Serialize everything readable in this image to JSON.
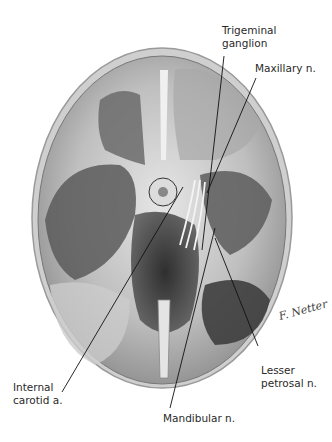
{
  "figure": {
    "signature": "F. Netter"
  },
  "labels": [
    {
      "id": "trigeminal-ganglion",
      "lines": [
        "Trigeminal",
        "ganglion"
      ]
    },
    {
      "id": "maxillary-n",
      "lines": [
        "Maxillary n."
      ]
    },
    {
      "id": "internal-carotid-a",
      "lines": [
        "Internal",
        "carotid a."
      ]
    },
    {
      "id": "lesser-petrosal-n",
      "lines": [
        "Lesser",
        "petrosal n."
      ]
    },
    {
      "id": "mandibular-n",
      "lines": [
        "Mandibular n."
      ]
    }
  ],
  "colors": {
    "background": "#ffffff",
    "skull_edge": "#bdbdbd",
    "fossa_dark": "#4a4a4a",
    "bone_light": "#d8d8d8",
    "leader": "#111111",
    "text": "#2a2a2a"
  }
}
